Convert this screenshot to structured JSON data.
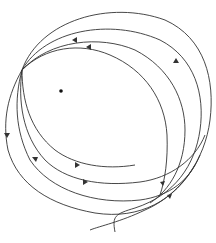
{
  "figure": {
    "colors": {
      "line": "#333333",
      "background": "#ffffff",
      "center_dot": "#111111"
    },
    "center_point": {
      "x": 61,
      "y": 91
    },
    "convergence_point": {
      "x": 22,
      "y": 70
    },
    "arrow_count": 9
  }
}
